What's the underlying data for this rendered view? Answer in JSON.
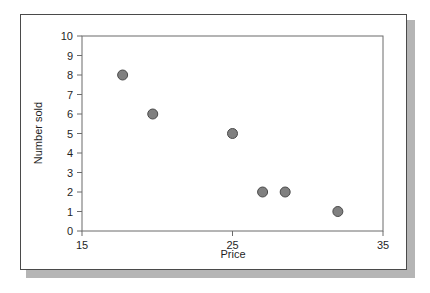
{
  "chart_data": {
    "type": "scatter",
    "title": "",
    "xlabel": "Price",
    "ylabel": "Number sold",
    "xlim": [
      15,
      35
    ],
    "ylim": [
      0,
      10
    ],
    "xticks": [
      15,
      25,
      35
    ],
    "xtick_labels": [
      "15",
      "25",
      "35"
    ],
    "yticks": [
      0,
      1,
      2,
      3,
      4,
      5,
      6,
      7,
      8,
      9,
      10
    ],
    "ytick_labels": [
      "0",
      "1",
      "2",
      "3",
      "4",
      "5",
      "6",
      "7",
      "8",
      "9",
      "10"
    ],
    "grid": false,
    "legend": null,
    "series": [
      {
        "name": "",
        "marker": "circle",
        "marker_color": "#808080",
        "marker_edge_color": "#4a4a4a",
        "points": [
          {
            "x": 17.7,
            "y": 8
          },
          {
            "x": 19.7,
            "y": 6
          },
          {
            "x": 25.0,
            "y": 5
          },
          {
            "x": 27.0,
            "y": 2
          },
          {
            "x": 28.5,
            "y": 2
          },
          {
            "x": 32.0,
            "y": 1
          }
        ]
      }
    ]
  },
  "figure": {
    "border_color": "#4a4a4a",
    "shadow_color": "#b5b5b5",
    "axis_color": "#6b6b6b",
    "background": "#ffffff"
  }
}
